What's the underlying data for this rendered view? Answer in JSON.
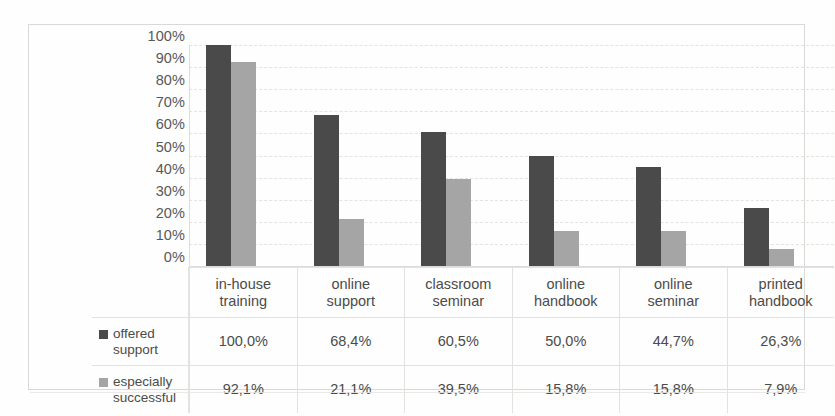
{
  "chart_data": {
    "type": "bar",
    "title": "",
    "subtitle": "",
    "xlabel": "",
    "ylabel": "",
    "ylim": [
      0,
      100
    ],
    "grid": true,
    "legend_position": "table-left-column",
    "categories": [
      "in-house training",
      "online support",
      "classroom seminar",
      "online handbook",
      "online seminar",
      "printed handbook"
    ],
    "category_lines": [
      [
        "in-house",
        "training"
      ],
      [
        "online",
        "support"
      ],
      [
        "classroom",
        "seminar"
      ],
      [
        "online",
        "handbook"
      ],
      [
        "online",
        "seminar"
      ],
      [
        "printed",
        "handbook"
      ]
    ],
    "series": [
      {
        "name": "offered support",
        "name_lines": [
          "offered",
          "support"
        ],
        "color": "#4a4a4a",
        "values": [
          100.0,
          68.4,
          60.5,
          50.0,
          44.7,
          26.3
        ],
        "labels": [
          "100,0%",
          "68,4%",
          "60,5%",
          "50,0%",
          "44,7%",
          "26,3%"
        ]
      },
      {
        "name": "especially successful",
        "name_lines": [
          "especially",
          "successful"
        ],
        "color": "#a5a5a5",
        "values": [
          92.1,
          21.1,
          39.5,
          15.8,
          15.8,
          7.9
        ],
        "labels": [
          "92,1%",
          "21,1%",
          "39,5%",
          "15,8%",
          "15,8%",
          "7,9%"
        ]
      }
    ],
    "yticks": [
      "100%",
      "90%",
      "80%",
      "70%",
      "60%",
      "50%",
      "40%",
      "30%",
      "20%",
      "10%",
      "0%"
    ],
    "ytick_values": [
      100,
      90,
      80,
      70,
      60,
      50,
      40,
      30,
      20,
      10,
      0
    ]
  },
  "colors": {
    "series_offered_support": "#4a4a4a",
    "series_especially_successful": "#a5a5a5",
    "gridline": "#e4e3e0",
    "border": "#d9d9d6",
    "text": "#4b4b49",
    "background": "#fefefe"
  }
}
